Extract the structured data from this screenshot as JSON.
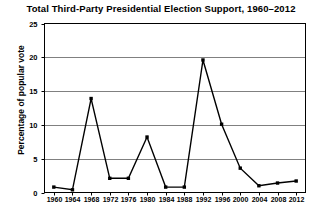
{
  "chart_data": {
    "type": "line",
    "title": "Total Third-Party Presidential Election Support, 1960–2012",
    "xlabel": "",
    "ylabel": "Percentage of popular vote",
    "categories": [
      "1960",
      "1964",
      "1968",
      "1972",
      "1976",
      "1980",
      "1984",
      "1988",
      "1992",
      "1996",
      "2000",
      "2004",
      "2008",
      "2012"
    ],
    "values": [
      0.8,
      0.4,
      13.9,
      2.1,
      2.1,
      8.2,
      0.8,
      0.8,
      19.6,
      10.1,
      3.6,
      1.0,
      1.4,
      1.7
    ],
    "series": [
      {
        "name": "Third-party share of popular vote",
        "values": [
          0.8,
          0.4,
          13.9,
          2.1,
          2.1,
          8.2,
          0.8,
          0.8,
          19.6,
          10.1,
          3.6,
          1.0,
          1.4,
          1.7
        ]
      }
    ],
    "ylim": [
      0,
      25
    ],
    "yticks": [
      0,
      5,
      10,
      15,
      20,
      25
    ],
    "ytick_labels": [
      "0",
      "5",
      "10",
      "15",
      "20",
      "25"
    ],
    "xtick_labels": [
      "1960",
      "1964",
      "1968",
      "1972",
      "1976",
      "1980",
      "1984",
      "1988",
      "1992",
      "1996",
      "2000",
      "2004",
      "2008",
      "2012"
    ],
    "grid": "horizontal",
    "legend": "none",
    "marker": "square",
    "line_color": "#000000",
    "marker_color": "#000000",
    "grid_color": "#808080",
    "axis_color": "#000000",
    "background": "#ffffff"
  }
}
